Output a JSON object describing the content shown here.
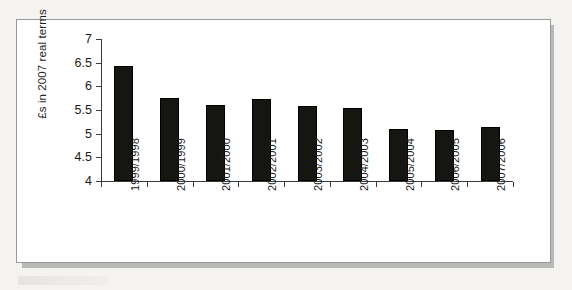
{
  "chart_data": {
    "type": "bar",
    "title": "",
    "xlabel": "",
    "ylabel": "£s in 2007 real terms",
    "ylim": [
      4,
      7
    ],
    "yticks": [
      4,
      4.5,
      5,
      5.5,
      6,
      6.5,
      7
    ],
    "ytick_labels": [
      "4",
      "4.5",
      "5",
      "5.5",
      "6",
      "6.5",
      "7"
    ],
    "grid": false,
    "legend": null,
    "categories": [
      "1999/1998",
      "2000/1999",
      "2001/2000",
      "2002/2001",
      "2003/2002",
      "2004/2003",
      "2005/2004",
      "2006/2005",
      "2007/2006"
    ],
    "values": [
      6.42,
      5.75,
      5.61,
      5.74,
      5.58,
      5.54,
      5.1,
      5.07,
      5.15
    ],
    "bar_color": "#151512"
  },
  "figure": {
    "border_color": "#9a9a98",
    "background": "#ffffff",
    "shadow_color": "#b9b9b7"
  },
  "page": {
    "background": "#f4f3f1"
  }
}
